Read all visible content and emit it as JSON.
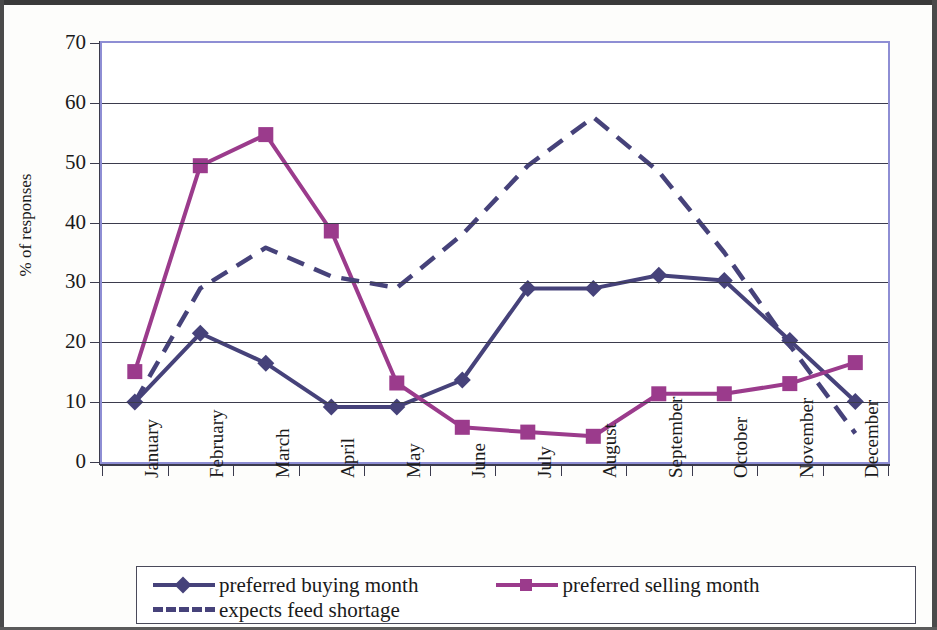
{
  "chart_data": {
    "type": "line",
    "title": "",
    "subtitle": "",
    "xlabel": "",
    "ylabel": "% of responses",
    "ylim": [
      0,
      70
    ],
    "ytick_step": 10,
    "yticks": [
      "0",
      "10",
      "20",
      "30",
      "40",
      "50",
      "60",
      "70"
    ],
    "grid": true,
    "legend_position": "bottom",
    "categories": [
      "January",
      "February",
      "March",
      "April",
      "May",
      "June",
      "July",
      "August",
      "September",
      "October",
      "November",
      "December"
    ],
    "series": [
      {
        "name": "preferred buying month",
        "marker": "diamond",
        "style": "solid",
        "color": "#46427a",
        "values": [
          10.0,
          21.5,
          16.5,
          9.2,
          9.2,
          13.7,
          29.0,
          29.0,
          31.2,
          30.3,
          20.3,
          10.1
        ]
      },
      {
        "name": "preferred selling month",
        "marker": "square",
        "style": "solid",
        "color": "#9b3b8c",
        "values": [
          15.1,
          49.5,
          54.7,
          38.6,
          13.2,
          5.8,
          5.0,
          4.3,
          11.4,
          11.4,
          13.1,
          16.6
        ]
      },
      {
        "name": "expects feed shortage",
        "marker": "none",
        "style": "dashed",
        "color": "#46427a",
        "values": [
          10.0,
          29.0,
          35.8,
          31.0,
          29.1,
          38.0,
          49.5,
          57.6,
          48.5,
          35.0,
          19.5,
          4.8
        ]
      }
    ]
  },
  "axis": {
    "y_title": "% of responses"
  },
  "legend": {
    "items": [
      {
        "label": "preferred buying month",
        "marker": "diamond",
        "style": "solid",
        "color": "#46427a"
      },
      {
        "label": "preferred selling month",
        "marker": "square",
        "style": "solid",
        "color": "#9b3b8c"
      },
      {
        "label": "expects feed shortage",
        "marker": "dash",
        "style": "dashed",
        "color": "#46427a"
      }
    ]
  },
  "colors": {
    "buying": "#46427a",
    "selling": "#9b3b8c",
    "shortage": "#46427a",
    "plot_border": "#8e8ed4",
    "gridline": "#3b3b4d",
    "text": "#1a1a1a",
    "background": "#ffffff"
  }
}
